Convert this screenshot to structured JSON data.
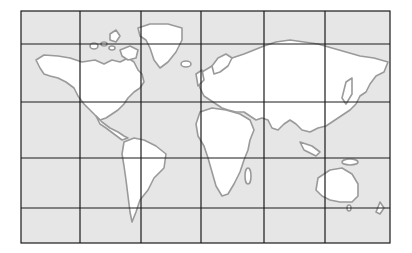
{
  "map": {
    "type": "world-map-grid",
    "ocean_color": "#e6e6e6",
    "land_color": "#ffffff",
    "coast_color": "#9a9a9a",
    "grid_color": "#1a1a1a",
    "background": "#ffffff",
    "frame": {
      "x": 21,
      "y": 11,
      "width": 369,
      "height": 232
    },
    "grid": {
      "columns": 6,
      "rows": 5,
      "vertical_lines_x": [
        21,
        80,
        141,
        201,
        264,
        325,
        390
      ],
      "horizontal_lines_y": [
        11,
        44,
        102,
        158,
        208,
        243
      ]
    },
    "landmasses": [
      "North America",
      "Greenland",
      "South America",
      "Europe",
      "Africa",
      "Asia",
      "Australia",
      "New Zealand",
      "Antarctica-none"
    ]
  }
}
